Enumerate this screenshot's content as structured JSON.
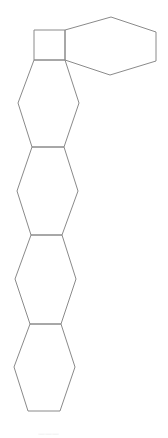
{
  "diagram": {
    "type": "chemical-structure",
    "background": "#ffffff",
    "stroke_color": "#8a8a8a",
    "rings": [
      {
        "name": "cyclobutane-square",
        "points": "34,30 65,30 65,60 34,60"
      },
      {
        "name": "hexagon-right",
        "points": "65,30 111,17 156,32 156,61 110,75 65,60"
      },
      {
        "name": "hexagon-1",
        "points": "34,60 65,60 79,103 64,147 32,147 18,103"
      },
      {
        "name": "hexagon-2",
        "points": "32,147 64,147 78,191 62,235 31,235 17,191"
      },
      {
        "name": "hexagon-3",
        "points": "31,235 62,235 76,279 61,324 30,324 15,279"
      },
      {
        "name": "hexagon-4",
        "points": "30,324 61,324 75,367 60,411 28,411 14,367"
      }
    ],
    "caption": "———"
  }
}
